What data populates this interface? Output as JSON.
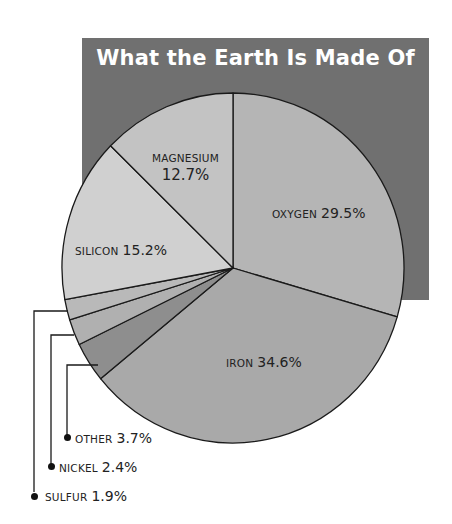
{
  "title": "What the Earth Is Made Of",
  "colors": {
    "title_box": "#707070",
    "title_text": "#ffffff",
    "oxygen": "#b5b5b5",
    "iron": "#a9a9a9",
    "other": "#8e8e8e",
    "nickel": "#b0b0b0",
    "sulfur": "#b9b9b9",
    "silicon": "#d0d0d0",
    "magnesium": "#c3c3c3",
    "outline": "#1a1a1a"
  },
  "labels": {
    "oxygen": {
      "name": "OXYGEN",
      "pct": "29.5%"
    },
    "iron": {
      "name": "IRON",
      "pct": "34.6%"
    },
    "other": {
      "name": "OTHER",
      "pct": "3.7%"
    },
    "nickel": {
      "name": "NICKEL",
      "pct": "2.4%"
    },
    "sulfur": {
      "name": "SULFUR",
      "pct": "1.9%"
    },
    "silicon": {
      "name": "SILICON",
      "pct": "15.2%"
    },
    "magnesium": {
      "name": "MAGNESIUM",
      "pct": "12.7%"
    }
  },
  "chart_data": {
    "type": "pie",
    "title": "What the Earth Is Made Of",
    "categories": [
      "Oxygen",
      "Iron",
      "Other",
      "Nickel",
      "Sulfur",
      "Silicon",
      "Magnesium"
    ],
    "values": [
      29.5,
      34.6,
      3.7,
      2.4,
      1.9,
      15.2,
      12.7
    ],
    "unit": "%",
    "start_angle": "12 o'clock",
    "direction": "clockwise",
    "legend": "none (direct labels; Other, Nickel, Sulfur use leader lines)"
  }
}
